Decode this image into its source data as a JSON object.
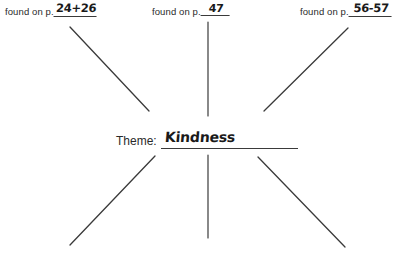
{
  "worksheet": {
    "background_color": "#ffffff",
    "ink_color": "#2a2a2a",
    "handwriting_color": "#1a1a1a",
    "source_prefix": "found on p.",
    "center": {
      "label": "Theme:",
      "value": "Kindness"
    },
    "sources": [
      {
        "id": "left",
        "prefix": "found on p.",
        "page": "24+26"
      },
      {
        "id": "center",
        "prefix": "found on p.",
        "page": "47"
      },
      {
        "id": "right",
        "prefix": "found on p.",
        "page": "56-57"
      }
    ],
    "spokes": [
      {
        "id": "top-left",
        "x1": 70,
        "y1": 27,
        "x2": 149,
        "y2": 111
      },
      {
        "id": "top-center",
        "x1": 208,
        "y1": 22,
        "x2": 208,
        "y2": 116
      },
      {
        "id": "top-right",
        "x1": 348,
        "y1": 28,
        "x2": 264,
        "y2": 111
      },
      {
        "id": "bottom-left",
        "x1": 70,
        "y1": 245,
        "x2": 155,
        "y2": 156
      },
      {
        "id": "bottom-center",
        "x1": 208,
        "y1": 238,
        "x2": 208,
        "y2": 155
      },
      {
        "id": "bottom-right",
        "x1": 345,
        "y1": 247,
        "x2": 258,
        "y2": 157
      }
    ]
  }
}
